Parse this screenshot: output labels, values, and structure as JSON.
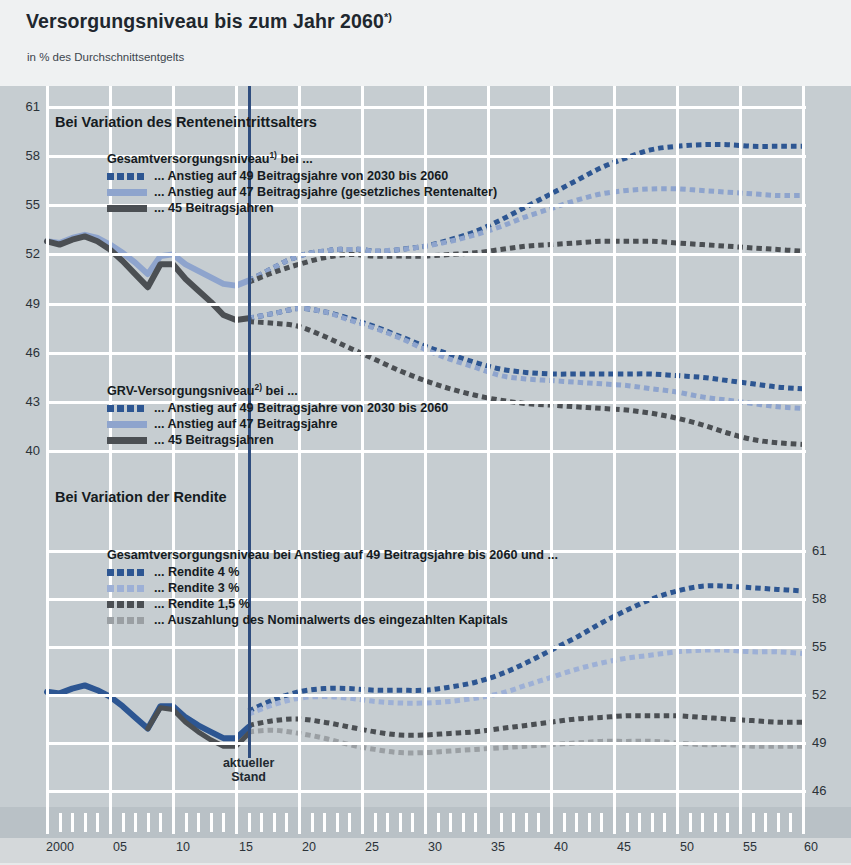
{
  "header": {
    "title": "Versorgungsniveau bis zum Jahr 2060",
    "title_sup": "*)",
    "subtitle": "in % des Durchschnittsentgelts"
  },
  "sections": {
    "upper_heading": "Bei Variation des Renteneintrittsalters",
    "lower_heading": "Bei Variation der Rendite"
  },
  "legends": {
    "gesamt": {
      "title": "Gesamtversorgungsniveau",
      "title_sup": "1)",
      "title_tail": " bei ...",
      "items": [
        {
          "label": "... Anstieg auf 49 Beitragsjahre von 2030 bis 2060",
          "color": "#2d5692",
          "style": "dash"
        },
        {
          "label": "... Anstieg auf 47 Beitragsjahre (gesetzliches Rentenalter)",
          "color": "#8ea4cd",
          "style": "solid"
        },
        {
          "label": "... 45 Beitragsjahren",
          "color": "#4b4f53",
          "style": "solid"
        }
      ]
    },
    "grv": {
      "title": "GRV-Versorgungsniveau",
      "title_sup": "2)",
      "title_tail": " bei ...",
      "items": [
        {
          "label": "... Anstieg auf 49 Beitragsjahre von 2030 bis 2060",
          "color": "#2d5692",
          "style": "dash"
        },
        {
          "label": "... Anstieg auf 47 Beitragsjahre",
          "color": "#8ea4cd",
          "style": "solid"
        },
        {
          "label": "... 45 Beitragsjahren",
          "color": "#4b4f53",
          "style": "solid"
        }
      ]
    },
    "rendite": {
      "title": "Gesamtversorgungsniveau bei Anstieg auf 49 Beitragsjahre bis 2060 und ...",
      "title_sup": "",
      "title_tail": "",
      "items": [
        {
          "label": "... Rendite 4 %",
          "color": "#2d5692",
          "style": "dash"
        },
        {
          "label": "... Rendite 3 %",
          "color": "#9db0d6",
          "style": "dash"
        },
        {
          "label": "... Rendite 1,5 %",
          "color": "#4b4f53",
          "style": "dash"
        },
        {
          "label": "... Auszahlung des Nominalwerts des eingezahlten Kapitals",
          "color": "#9a9fa3",
          "style": "dash"
        }
      ]
    }
  },
  "annotations": {
    "now_line_label_line1": "aktueller",
    "now_line_label_line2": "Stand",
    "now_year": 2016
  },
  "colors": {
    "plot_background": "#c6cdd1",
    "header_background": "#eff1f2",
    "grid": "#ffffff",
    "now_line": "#2f4d7e",
    "dark_blue": "#2d5692",
    "light_blue": "#8ea4cd",
    "pale_blue": "#9db0d6",
    "dark_gray": "#4b4f53",
    "light_gray": "#9a9fa3",
    "axis_band": "#b9c1c6"
  },
  "chart_data": {
    "type": "line",
    "title": "Versorgungsniveau bis zum Jahr 2060",
    "subtitle": "in % des Durchschnittsentgelts",
    "xlabel": "",
    "ylabel": "in % des Durchschnittsentgelts",
    "grid": true,
    "legend_position": "inside-top-left",
    "panels": [
      {
        "name": "Bei Variation des Renteneintrittsalters",
        "ylim": [
          38.5,
          61.8
        ],
        "yticks": [
          40,
          43,
          46,
          49,
          52,
          55,
          58,
          61
        ],
        "ytick_side": "left",
        "xlim": [
          2000,
          2060
        ],
        "xticks": [
          2000,
          2005,
          2010,
          2015,
          2020,
          2025,
          2030,
          2035,
          2040,
          2045,
          2050,
          2055,
          2060
        ],
        "xticklabels": [
          "2000",
          "05",
          "10",
          "15",
          "20",
          "25",
          "30",
          "35",
          "40",
          "45",
          "50",
          "55",
          "60"
        ],
        "series": [
          {
            "name": "Gesamtversorgungsniveau – Anstieg auf 49 Beitragsjahre von 2030 bis 2060",
            "color": "#2d5692",
            "style": "dashed",
            "width": 5,
            "x": [
              2016,
              2017,
              2018,
              2019,
              2020,
              2021,
              2022,
              2023,
              2024,
              2025,
              2026,
              2027,
              2028,
              2029,
              2030,
              2032,
              2034,
              2036,
              2038,
              2040,
              2042,
              2044,
              2046,
              2048,
              2050,
              2052,
              2054,
              2056,
              2058,
              2060
            ],
            "y": [
              50.4,
              50.8,
              51.2,
              51.6,
              51.9,
              52.1,
              52.2,
              52.3,
              52.3,
              52.3,
              52.2,
              52.2,
              52.3,
              52.4,
              52.5,
              52.9,
              53.4,
              54.1,
              54.9,
              55.7,
              56.5,
              57.3,
              57.9,
              58.4,
              58.6,
              58.7,
              58.7,
              58.6,
              58.6,
              58.6
            ]
          },
          {
            "name": "Gesamtversorgungsniveau – Anstieg auf 47 Beitragsjahre (gesetzliches Rentenalter)",
            "color": "#8ea4cd",
            "style": "dashed",
            "width": 5,
            "x": [
              2016,
              2017,
              2018,
              2019,
              2020,
              2021,
              2022,
              2023,
              2024,
              2025,
              2026,
              2028,
              2030,
              2032,
              2034,
              2036,
              2038,
              2040,
              2042,
              2044,
              2046,
              2048,
              2050,
              2052,
              2054,
              2056,
              2058,
              2060
            ],
            "y": [
              50.4,
              50.8,
              51.2,
              51.6,
              51.9,
              52.1,
              52.2,
              52.3,
              52.3,
              52.3,
              52.2,
              52.3,
              52.5,
              52.8,
              53.2,
              53.7,
              54.3,
              54.8,
              55.3,
              55.7,
              55.9,
              56.0,
              56.0,
              55.9,
              55.8,
              55.7,
              55.6,
              55.6
            ]
          },
          {
            "name": "Gesamtversorgungsniveau – 45 Beitragsjahren",
            "color": "#4b4f53",
            "style": "dashed",
            "width": 5,
            "x": [
              2016,
              2018,
              2020,
              2022,
              2024,
              2026,
              2028,
              2030,
              2032,
              2034,
              2036,
              2038,
              2040,
              2042,
              2044,
              2046,
              2048,
              2050,
              2052,
              2054,
              2056,
              2058,
              2060
            ],
            "y": [
              50.3,
              50.9,
              51.4,
              51.8,
              52.0,
              51.9,
              51.9,
              51.9,
              52.0,
              52.1,
              52.3,
              52.5,
              52.6,
              52.7,
              52.8,
              52.8,
              52.8,
              52.7,
              52.6,
              52.5,
              52.4,
              52.3,
              52.2
            ]
          },
          {
            "name": "GRV-Versorgungsniveau – Anstieg auf 49 Beitragsjahre von 2030 bis 2060",
            "color": "#2d5692",
            "style": "dashed",
            "width": 5,
            "x": [
              2016,
              2018,
              2020,
              2022,
              2024,
              2026,
              2028,
              2030,
              2032,
              2034,
              2036,
              2038,
              2040,
              2042,
              2044,
              2046,
              2048,
              2050,
              2052,
              2054,
              2056,
              2058,
              2060
            ],
            "y": [
              48.1,
              48.4,
              48.7,
              48.5,
              48.1,
              47.6,
              47.0,
              46.4,
              45.9,
              45.4,
              45.0,
              44.8,
              44.7,
              44.7,
              44.7,
              44.7,
              44.7,
              44.6,
              44.5,
              44.3,
              44.1,
              43.9,
              43.8
            ]
          },
          {
            "name": "GRV-Versorgungsniveau – Anstieg auf 47 Beitragsjahre",
            "color": "#8ea4cd",
            "style": "dashed",
            "width": 5,
            "x": [
              2016,
              2018,
              2020,
              2022,
              2024,
              2026,
              2028,
              2030,
              2032,
              2034,
              2036,
              2038,
              2040,
              2042,
              2044,
              2046,
              2048,
              2050,
              2052,
              2054,
              2056,
              2058,
              2060
            ],
            "y": [
              48.1,
              48.4,
              48.7,
              48.5,
              48.0,
              47.5,
              46.9,
              46.2,
              45.6,
              45.1,
              44.6,
              44.4,
              44.3,
              44.2,
              44.1,
              44.0,
              43.8,
              43.6,
              43.3,
              43.1,
              42.9,
              42.7,
              42.6
            ]
          },
          {
            "name": "GRV-Versorgungsniveau – 45 Beitragsjahren",
            "color": "#4b4f53",
            "style": "dashed",
            "width": 5,
            "x": [
              2016,
              2018,
              2020,
              2022,
              2024,
              2026,
              2028,
              2030,
              2032,
              2034,
              2036,
              2038,
              2040,
              2042,
              2044,
              2046,
              2048,
              2050,
              2052,
              2054,
              2056,
              2058,
              2060
            ],
            "y": [
              47.9,
              47.8,
              47.6,
              47.0,
              46.3,
              45.6,
              44.9,
              44.3,
              43.8,
              43.4,
              43.1,
              42.9,
              42.8,
              42.7,
              42.6,
              42.5,
              42.3,
              42.0,
              41.6,
              41.1,
              40.7,
              40.5,
              40.4
            ]
          },
          {
            "name": "Historie Gesamtversorgungsniveau (bis 2016)",
            "color": "#8ea4cd",
            "style": "solid",
            "width": 6,
            "x": [
              2000,
              2001,
              2002,
              2003,
              2004,
              2005,
              2006,
              2007,
              2008,
              2009,
              2010,
              2011,
              2012,
              2013,
              2014,
              2015,
              2016
            ],
            "y": [
              52.8,
              52.7,
              53.0,
              53.2,
              53.0,
              52.6,
              52.1,
              51.5,
              50.8,
              51.9,
              52.0,
              51.4,
              51.0,
              50.6,
              50.2,
              50.1,
              50.4
            ]
          },
          {
            "name": "Historie GRV-Versorgungsniveau (bis 2016)",
            "color": "#4b4f53",
            "style": "solid",
            "width": 6,
            "x": [
              2000,
              2001,
              2002,
              2003,
              2004,
              2005,
              2006,
              2007,
              2008,
              2009,
              2010,
              2011,
              2012,
              2013,
              2014,
              2015,
              2016
            ],
            "y": [
              52.8,
              52.6,
              52.9,
              53.1,
              52.8,
              52.3,
              51.6,
              50.8,
              50.0,
              51.4,
              51.4,
              50.5,
              49.8,
              49.1,
              48.3,
              48.0,
              48.1
            ]
          }
        ]
      },
      {
        "name": "Bei Variation der Rendite",
        "ylim": [
          45.2,
          61.8
        ],
        "yticks": [
          46,
          49,
          52,
          55,
          58,
          61
        ],
        "ytick_side": "right",
        "xlim": [
          2000,
          2060
        ],
        "series": [
          {
            "name": "Rendite 4 %",
            "color": "#2d5692",
            "style": "dashed",
            "width": 5,
            "x": [
              2016,
              2018,
              2020,
              2022,
              2024,
              2026,
              2028,
              2030,
              2032,
              2034,
              2036,
              2038,
              2040,
              2042,
              2044,
              2046,
              2048,
              2050,
              2052,
              2054,
              2056,
              2058,
              2060
            ],
            "y": [
              51.0,
              51.7,
              52.2,
              52.4,
              52.4,
              52.3,
              52.3,
              52.3,
              52.5,
              52.8,
              53.3,
              54.0,
              54.8,
              55.6,
              56.5,
              57.3,
              58.0,
              58.5,
              58.8,
              58.8,
              58.7,
              58.6,
              58.5
            ]
          },
          {
            "name": "Rendite 3 %",
            "color": "#9db0d6",
            "style": "dashed",
            "width": 5,
            "x": [
              2016,
              2018,
              2020,
              2022,
              2024,
              2026,
              2028,
              2030,
              2032,
              2034,
              2036,
              2038,
              2040,
              2042,
              2044,
              2046,
              2048,
              2050,
              2052,
              2054,
              2056,
              2058,
              2060
            ],
            "y": [
              50.8,
              51.4,
              51.8,
              51.9,
              51.8,
              51.6,
              51.5,
              51.5,
              51.6,
              51.8,
              52.1,
              52.6,
              53.1,
              53.6,
              54.0,
              54.3,
              54.5,
              54.7,
              54.8,
              54.8,
              54.7,
              54.7,
              54.6
            ]
          },
          {
            "name": "Rendite 1,5 %",
            "color": "#4b4f53",
            "style": "dashed",
            "width": 5,
            "x": [
              2016,
              2018,
              2020,
              2022,
              2024,
              2026,
              2028,
              2030,
              2032,
              2034,
              2036,
              2038,
              2040,
              2042,
              2044,
              2046,
              2048,
              2050,
              2052,
              2054,
              2056,
              2058,
              2060
            ],
            "y": [
              50.1,
              50.4,
              50.5,
              50.3,
              50.0,
              49.7,
              49.5,
              49.5,
              49.6,
              49.7,
              49.9,
              50.1,
              50.3,
              50.5,
              50.6,
              50.7,
              50.7,
              50.7,
              50.6,
              50.5,
              50.4,
              50.3,
              50.3
            ]
          },
          {
            "name": "Auszahlung des Nominalwerts des eingezahlten Kapitals",
            "color": "#9a9fa3",
            "style": "dashed",
            "width": 5,
            "x": [
              2016,
              2018,
              2020,
              2022,
              2024,
              2026,
              2028,
              2030,
              2032,
              2034,
              2036,
              2038,
              2040,
              2042,
              2044,
              2046,
              2048,
              2050,
              2052,
              2054,
              2056,
              2058,
              2060
            ],
            "y": [
              49.7,
              49.8,
              49.6,
              49.3,
              48.9,
              48.6,
              48.4,
              48.4,
              48.5,
              48.6,
              48.7,
              48.8,
              48.9,
              49.0,
              49.1,
              49.1,
              49.1,
              49.0,
              48.9,
              48.9,
              48.8,
              48.8,
              48.8
            ]
          },
          {
            "name": "Historie (bis 2016)",
            "color": "#2d5692",
            "style": "solid",
            "width": 6,
            "x": [
              2000,
              2001,
              2002,
              2003,
              2004,
              2005,
              2006,
              2007,
              2008,
              2009,
              2010,
              2011,
              2012,
              2013,
              2014,
              2015,
              2016
            ],
            "y": [
              52.2,
              52.1,
              52.4,
              52.6,
              52.3,
              51.9,
              51.3,
              50.6,
              49.9,
              51.3,
              51.3,
              50.6,
              50.1,
              49.7,
              49.3,
              49.3,
              50.0
            ]
          },
          {
            "name": "Historie unteres Band (bis 2016)",
            "color": "#4b4f53",
            "style": "solid",
            "width": 5,
            "x": [
              2008,
              2009,
              2010,
              2011,
              2012,
              2013,
              2014,
              2015,
              2016
            ],
            "y": [
              49.9,
              51.2,
              51.1,
              50.3,
              49.7,
              49.2,
              48.8,
              48.8,
              49.6
            ]
          }
        ]
      }
    ]
  }
}
